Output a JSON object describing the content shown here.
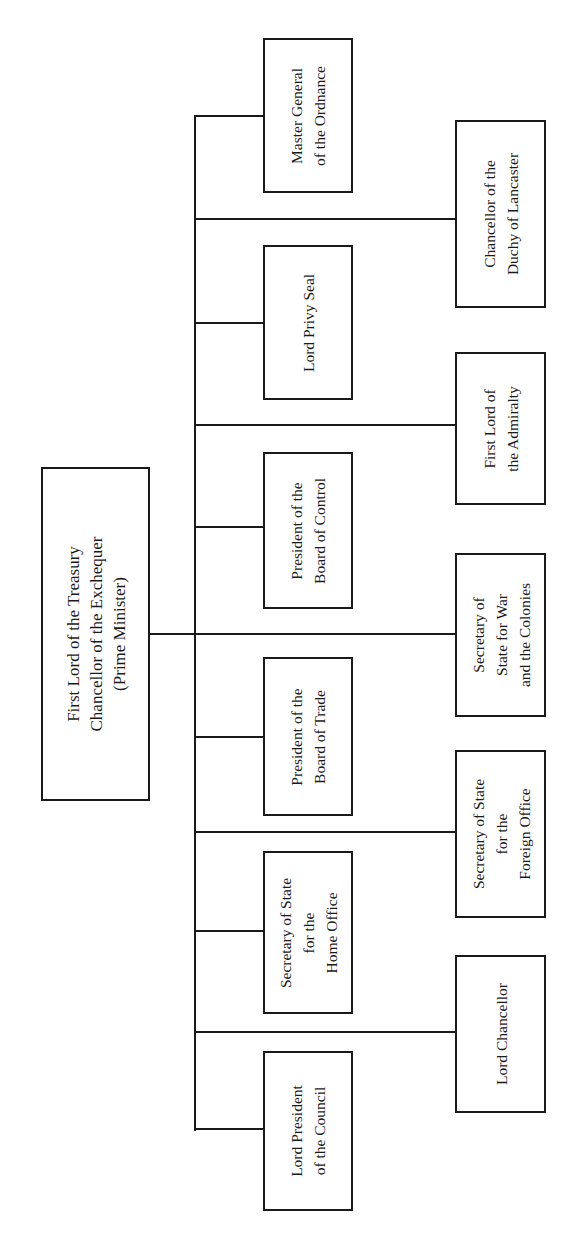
{
  "diagram": {
    "type": "organization-chart",
    "orientation": "rotated-90-ccw",
    "line_color": "#1a1a1a",
    "background": "#ffffff",
    "root": {
      "id": "prime-minister",
      "lines": [
        "First Lord of the Treasury",
        "Chancellor of the Exchequer",
        "(Prime Minister)"
      ]
    },
    "offices": [
      {
        "id": "master-general-ordnance",
        "column": "inner",
        "lines": [
          "Master General",
          "of the Ordnance"
        ]
      },
      {
        "id": "chancellor-duchy-lancaster",
        "column": "outer",
        "lines": [
          "Chancellor of the",
          "Duchy of Lancaster"
        ]
      },
      {
        "id": "lord-privy-seal",
        "column": "inner",
        "lines": [
          "Lord Privy Seal"
        ]
      },
      {
        "id": "first-lord-admiralty",
        "column": "outer",
        "lines": [
          "First Lord of",
          "the Admiralty"
        ]
      },
      {
        "id": "president-board-control",
        "column": "inner",
        "lines": [
          "President of the",
          "Board of Control"
        ]
      },
      {
        "id": "secretary-war-colonies",
        "column": "outer",
        "lines": [
          "Secretary of",
          "State for War",
          "and the Colonies"
        ]
      },
      {
        "id": "president-board-trade",
        "column": "inner",
        "lines": [
          "President of the",
          "Board of Trade"
        ]
      },
      {
        "id": "secretary-foreign-office",
        "column": "outer",
        "lines": [
          "Secretary of State",
          "for the",
          "Foreign Office"
        ]
      },
      {
        "id": "secretary-home-office",
        "column": "inner",
        "lines": [
          "Secretary of State",
          "for the",
          "Home Office"
        ]
      },
      {
        "id": "lord-chancellor",
        "column": "outer",
        "lines": [
          "Lord Chancellor"
        ]
      },
      {
        "id": "lord-president-council",
        "column": "inner",
        "lines": [
          "Lord President",
          "of the Council"
        ]
      }
    ]
  }
}
